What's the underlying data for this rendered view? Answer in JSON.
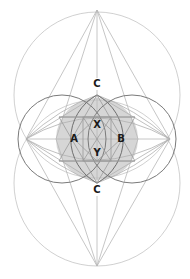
{
  "diagram": {
    "type": "geometric-construction",
    "colors": {
      "background": "#ffffff",
      "disc_fill": "#d6d6d6",
      "light_line": "#c4c4c4",
      "mid_line": "#a8a8a8",
      "dark_line": "#6e6e6e",
      "label": "#1a1a1a"
    },
    "labels": {
      "c_top": "C",
      "c_bottom": "C",
      "a": "A",
      "b": "B",
      "x": "X",
      "y": "Y"
    }
  }
}
